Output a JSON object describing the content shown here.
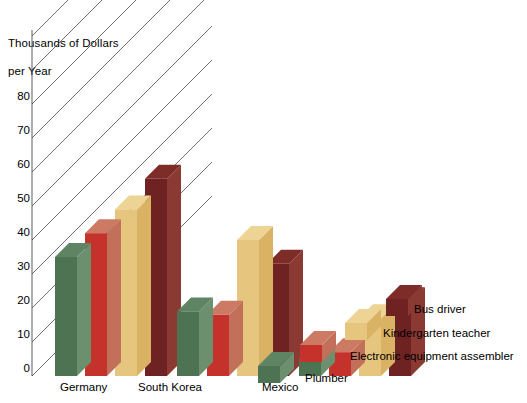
{
  "chart_data": {
    "type": "bar",
    "title": "",
    "ylabel": "Thousands of Dollars\nper Year",
    "xlabel": "",
    "categories": [
      "Germany",
      "South Korea",
      "Mexico"
    ],
    "yticks": [
      0,
      10,
      20,
      30,
      40,
      50,
      60,
      70,
      80
    ],
    "ylim": [
      0,
      90
    ],
    "grid": true,
    "legend_position": "right-inline",
    "projection": "3d-isometric-bars",
    "series": [
      {
        "name": "Plumber",
        "color": "#4e7353",
        "side_color": "#6c8f6d",
        "top_color": "#5f8463",
        "values": [
          35,
          19,
          5
        ]
      },
      {
        "name": "Electronic equipment assembler",
        "color": "#c4322b",
        "side_color": "#c2705a",
        "top_color": "#cc7a63",
        "values": [
          42,
          18,
          7
        ]
      },
      {
        "name": "Kindergarten teacher",
        "color": "#e6c67f",
        "side_color": "#d9b263",
        "top_color": "#edd394",
        "values": [
          49,
          40,
          17
        ]
      },
      {
        "name": "Bus driver",
        "color": "#6e2222",
        "side_color": "#8a3a33",
        "top_color": "#7d2c28",
        "values": [
          58,
          33,
          22
        ]
      }
    ]
  },
  "axis": {
    "y_title_line1": "Thousands of Dollars",
    "y_title_line2": "per Year",
    "tick_80": "80",
    "tick_70": "70",
    "tick_60": "60",
    "tick_50": "50",
    "tick_40": "40",
    "tick_30": "30",
    "tick_20": "20",
    "tick_10": "10",
    "tick_0": "0"
  },
  "xlabels": {
    "germany": "Germany",
    "south_korea": "South Korea",
    "mexico": "Mexico"
  },
  "legend": {
    "bus_driver": "Bus driver",
    "kindergarten_teacher": "Kindergarten teacher",
    "electronic_equipment_assembler": "Electronic equipment assembler",
    "plumber": "Plumber"
  }
}
